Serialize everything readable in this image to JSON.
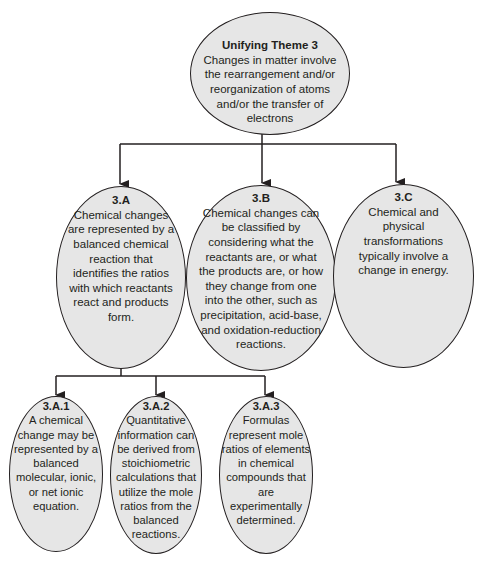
{
  "diagram": {
    "root": {
      "title": "Unifying Theme 3",
      "text": "Changes in matter involve the rearrangement and/or reorganization of atoms and/or the transfer of electrons"
    },
    "level1": [
      {
        "id": "3.A",
        "text": "Chemical changes are represented by a balanced chemical reaction that identifies the ratios with which reactants react and products form."
      },
      {
        "id": "3.B",
        "text": "Chemical changes can be classified by considering what the reactants are, or what the products are, or how they change from one into the other, such as precipitation, acid-base, and oxidation-reduction reactions."
      },
      {
        "id": "3.C",
        "text": "Chemical and physical transformations typically involve a change in energy."
      }
    ],
    "level2": [
      {
        "id": "3.A.1",
        "text": "A chemical change may be represented by a balanced molecular, ionic, or net ionic equation."
      },
      {
        "id": "3.A.2",
        "text": "Quantitative information can be derived from stoichiometric calculations that utilize the mole ratios from the balanced reactions."
      },
      {
        "id": "3.A.3",
        "text": "Formulas represent mole ratios of elements in chemical compounds that are experimentally determined."
      }
    ],
    "edges": [
      [
        "Unifying Theme 3",
        "3.A"
      ],
      [
        "Unifying Theme 3",
        "3.B"
      ],
      [
        "Unifying Theme 3",
        "3.C"
      ],
      [
        "3.A",
        "3.A.1"
      ],
      [
        "3.A",
        "3.A.2"
      ],
      [
        "3.A",
        "3.A.3"
      ]
    ],
    "colors": {
      "node_fill": "#e6e6e6",
      "stroke": "#231f20",
      "background": "#ffffff"
    }
  }
}
